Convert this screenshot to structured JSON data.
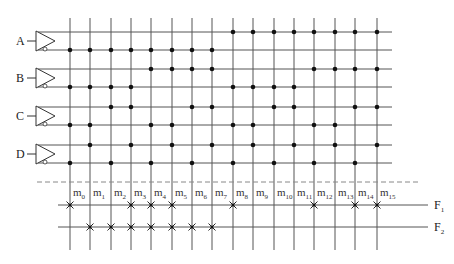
{
  "diagram": {
    "type": "PLA decoder array (4-input, 16 minterms)",
    "inputs": [
      "A",
      "B",
      "C",
      "D"
    ],
    "minterms": [
      "m0",
      "m1",
      "m2",
      "m3",
      "m4",
      "m5",
      "m6",
      "m7",
      "m8",
      "m9",
      "m10",
      "m11",
      "m12",
      "m13",
      "m14",
      "m15"
    ],
    "outputs": [
      {
        "name": "F",
        "sub": "1",
        "connections": [
          0,
          3,
          4,
          5,
          8,
          12,
          14,
          15
        ]
      },
      {
        "name": "F",
        "sub": "2",
        "connections": [
          1,
          2,
          3,
          4,
          5,
          6,
          7
        ]
      }
    ],
    "colors": {
      "line": "#555555",
      "dot": "#111111",
      "dashed": "#888888"
    }
  }
}
